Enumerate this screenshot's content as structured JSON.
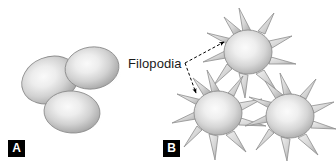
{
  "figure": {
    "width": 336,
    "height": 165,
    "background_color": "#ffffff",
    "type": "scientific-illustration"
  },
  "panels": [
    {
      "id": "A",
      "tag_label": "A",
      "tag_background_color": "#000000",
      "tag_text_color": "#ffffff",
      "cell_count": 3,
      "cell_shape": "smooth-ellipse"
    },
    {
      "id": "B",
      "tag_label": "B",
      "tag_background_color": "#000000",
      "tag_text_color": "#ffffff",
      "cell_count": 3,
      "cell_shape": "spiky-stellate"
    }
  ],
  "annotation": {
    "label": "Filopodia",
    "text_color": "#1a1a1a",
    "font_size_px": 13,
    "leader_style": "dashed",
    "leader_color": "#000000",
    "arrow_count": 2
  },
  "colors": {
    "cell_highlight": "#f2f2f2",
    "cell_midtone": "#cfcfcf",
    "cell_edge": "#9a9a9a",
    "cell_outline": "#8a8a8a",
    "shadow": "#bdbdbd",
    "background": "#ffffff"
  },
  "panel_a_cells": [
    {
      "name": "cell-a-upper-left",
      "cx": 50,
      "cy": 80,
      "rx": 29,
      "ry": 23,
      "rotate": -22
    },
    {
      "name": "cell-a-upper-right",
      "cx": 92,
      "cy": 68,
      "rx": 27,
      "ry": 21,
      "rotate": -8
    },
    {
      "name": "cell-a-lower",
      "cx": 72,
      "cy": 112,
      "rx": 28,
      "ry": 21,
      "rotate": 4
    }
  ],
  "panel_b_cells": [
    {
      "name": "cell-b-top",
      "cx": 248,
      "cy": 52,
      "r": 24,
      "spikes": 10
    },
    {
      "name": "cell-b-bottom-left",
      "cx": 218,
      "cy": 113,
      "r": 24,
      "spikes": 10
    },
    {
      "name": "cell-b-bottom-right",
      "cx": 290,
      "cy": 116,
      "r": 24,
      "spikes": 10
    }
  ]
}
